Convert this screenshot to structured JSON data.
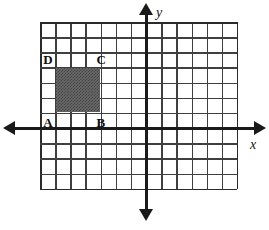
{
  "figure": {
    "background_color": "#ffffff"
  },
  "chart_data": {
    "type": "scatter",
    "title": "",
    "xlabel": "x",
    "ylabel": "y",
    "grid": true,
    "legend": null,
    "axis_style": {
      "x_axis_arrows": [
        "left",
        "right"
      ],
      "y_axis_arrows": [
        "up",
        "down"
      ],
      "axis_color": "#1a1a1a",
      "grid_color": "#3f3f3f",
      "tick_labels_shown": false
    },
    "grid_geometry": {
      "columns": 13,
      "rows": 11,
      "cell_size_px": 15.15,
      "origin_column_index": 7,
      "origin_row_index": 7
    },
    "xlim": [
      -7,
      6
    ],
    "ylim": [
      -4,
      7
    ],
    "shapes": [
      {
        "name": "shaded-rectangle",
        "kind": "rectangle",
        "fill": "#6a6a6a",
        "fill_pattern": "checkerboard-dither",
        "width_cells": 3,
        "height_cells": 3,
        "x_range": [
          -6,
          -3
        ],
        "y_range": [
          1,
          4
        ],
        "vertices": [
          {
            "label": "A",
            "corner": "bottom-left",
            "x": -6,
            "y": 1
          },
          {
            "label": "B",
            "corner": "bottom-right",
            "x": -3,
            "y": 1
          },
          {
            "label": "C",
            "corner": "top-right",
            "x": -3,
            "y": 4
          },
          {
            "label": "D",
            "corner": "top-left",
            "x": -6,
            "y": 4
          }
        ]
      }
    ]
  },
  "labels": {
    "x_axis": "x",
    "y_axis": "y",
    "vertex_a": "A",
    "vertex_b": "B",
    "vertex_c": "C",
    "vertex_d": "D"
  }
}
